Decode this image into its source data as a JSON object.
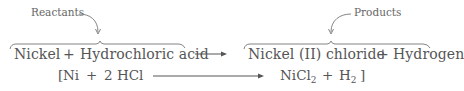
{
  "labels": {
    "reactants": "Reactants",
    "products": "Products"
  },
  "word_equation": {
    "reactant_1": "Nickel",
    "plus_1": "+",
    "reactant_2": "Hydrochloric acid",
    "arrow": "⟶",
    "product_1": "Nickel (II) chloride",
    "plus_2": "+",
    "product_2": "Hydrogen"
  },
  "formula_equation": {
    "open_bracket": "[",
    "reactant_1": "Ni",
    "plus_1": "+",
    "reactant_2": "2 HCl",
    "product_1_base": "NiCl",
    "product_1_sub": "2",
    "plus_2": "+",
    "product_2_base": "H",
    "product_2_sub": "2",
    "close_bracket": "]"
  },
  "colors": {
    "text": "#555555",
    "lines": "#777777"
  }
}
